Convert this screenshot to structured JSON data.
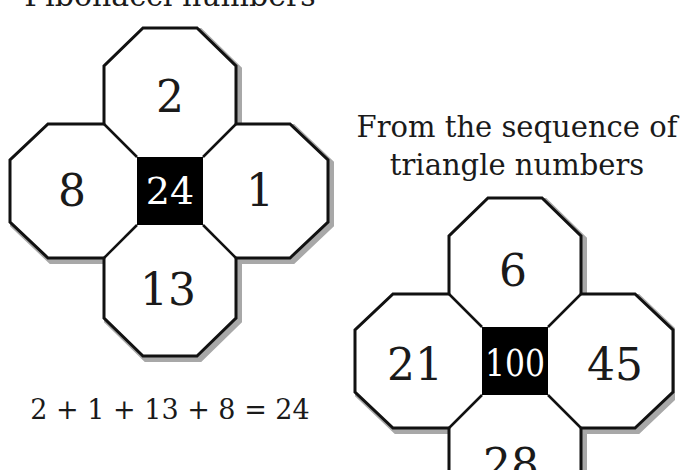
{
  "figure_left": {
    "title": "Fibonacci numbers",
    "top": "2",
    "left": "8",
    "right": "1",
    "bottom": "13",
    "center": "24",
    "equation": "2 + 1 + 13 + 8 = 24"
  },
  "figure_right": {
    "title_line1": "From the sequence of",
    "title_line2": "triangle numbers",
    "top": "6",
    "left": "21",
    "right": "45",
    "bottom": "28",
    "center": "100"
  },
  "colors": {
    "outline": "#111111",
    "shadow": "#a8a8a8",
    "center_fill": "#000000"
  }
}
